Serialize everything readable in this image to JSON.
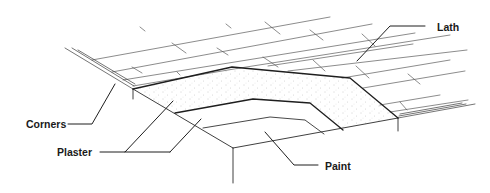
{
  "figure": {
    "type": "ceiling-cross-section-illustration",
    "labels": {
      "lath": "Lath",
      "corners": "Corners",
      "plaster": "Plaster",
      "paint": "Paint"
    },
    "colors": {
      "line": "#1e1e1e",
      "background": "#ffffff",
      "stipple": "#9a9a9a"
    }
  }
}
